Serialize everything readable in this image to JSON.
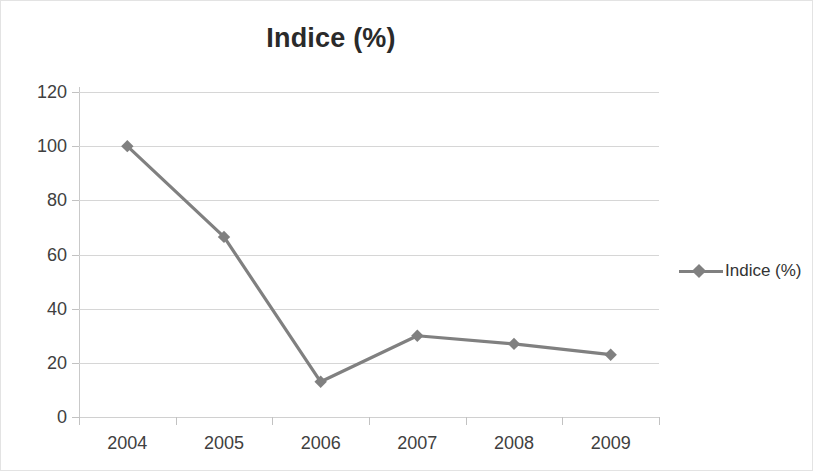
{
  "chart_data": {
    "type": "line",
    "title": "Indice (%)",
    "xlabel": "",
    "ylabel": "",
    "categories": [
      "2004",
      "2005",
      "2006",
      "2007",
      "2008",
      "2009"
    ],
    "series": [
      {
        "name": "Indice (%)",
        "values": [
          100,
          66.5,
          13,
          30,
          27,
          23
        ]
      }
    ],
    "ylim": [
      0,
      120
    ],
    "ytick_step": 20,
    "ytick_labels": [
      "0",
      "20",
      "40",
      "60",
      "80",
      "100",
      "120"
    ],
    "grid": true,
    "legend": {
      "position": "right",
      "entries": [
        "Indice (%)"
      ]
    },
    "marker": "diamond",
    "colors": {
      "series": "#808080",
      "gridline": "#d6d6d6",
      "axis": "#c9c9c9",
      "text": "#404040",
      "title": "#2a2a2a",
      "border": "#e3e3e3",
      "background": "#ffffff"
    }
  }
}
